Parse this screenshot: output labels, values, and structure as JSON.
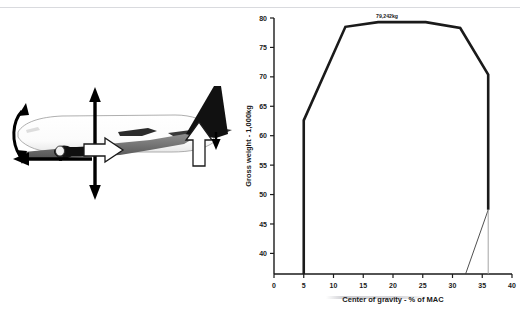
{
  "figure": {
    "name": "cg-envelope-figure",
    "panels": [
      "aircraft-force-diagram",
      "cg-envelope-chart"
    ]
  },
  "aircraft_diagram": {
    "name": "aircraft-side-view-force-diagram",
    "description": "Side view silhouette of a twin-engine jet airliner with force and moment arrows",
    "elements": [
      {
        "id": "fuselage",
        "label": "aircraft-fuselage"
      },
      {
        "id": "wing",
        "label": "aircraft-wing"
      },
      {
        "id": "vertical-stabilizer",
        "label": "aircraft-vertical-stabilizer"
      },
      {
        "id": "horizontal-stabilizer",
        "label": "aircraft-horizontal-stabilizer"
      },
      {
        "id": "engine",
        "label": "aircraft-engine-nacelle"
      },
      {
        "id": "lift-arrow",
        "label": "lift-arrow-up"
      },
      {
        "id": "weight-arrow",
        "label": "weight-arrow-down"
      },
      {
        "id": "thrust-arrow",
        "label": "thrust-arrow-right"
      },
      {
        "id": "drag-arrow",
        "label": "drag-arrow-left"
      },
      {
        "id": "pitch-arrow",
        "label": "pitch-moment-curved-arrow"
      },
      {
        "id": "tail-up-arrow",
        "label": "tail-load-arrow-up"
      },
      {
        "id": "tail-down-arrow",
        "label": "tail-load-arrow-down"
      }
    ]
  },
  "chart_data": {
    "type": "line",
    "title": "",
    "xlabel": "Center of gravity - % of MAC",
    "ylabel": "Gross weight - 1,000kg",
    "xlim": [
      0,
      40
    ],
    "ylim": [
      36.5,
      80
    ],
    "xticks": [
      0,
      5,
      10,
      15,
      20,
      25,
      30,
      35,
      40
    ],
    "xtick_labels": [
      "0",
      "5",
      "10",
      "15",
      "20",
      "25",
      "30",
      "35",
      "40"
    ],
    "yticks": [
      40,
      45,
      50,
      55,
      60,
      65,
      70,
      75,
      80
    ],
    "ytick_labels": [
      "40",
      "45",
      "50",
      "55",
      "60",
      "65",
      "70",
      "75",
      "80"
    ],
    "grid": false,
    "legend": null,
    "annotations": [
      {
        "text": "79,242kg",
        "x": 19.0,
        "y": 79.3,
        "name": "max-takeoff-weight-label"
      }
    ],
    "series": [
      {
        "name": "cg-envelope-boundary",
        "style": "solid-thick-black",
        "color": "#1a1a1a",
        "points": [
          [
            5.0,
            36.5
          ],
          [
            5.0,
            62.6
          ],
          [
            12.0,
            78.5
          ],
          [
            17.5,
            79.3
          ],
          [
            25.5,
            79.3
          ],
          [
            31.3,
            78.3
          ],
          [
            36.0,
            70.4
          ],
          [
            36.0,
            47.4
          ]
        ]
      },
      {
        "name": "aft-limit-taper-line",
        "style": "solid-thin-black",
        "color": "#3c3c3c",
        "points": [
          [
            36.0,
            47.4
          ],
          [
            32.2,
            36.5
          ]
        ]
      },
      {
        "name": "aft-reference-line",
        "style": "solid-thin-gray",
        "color": "#9a9a9a",
        "points": [
          [
            36.0,
            47.4
          ],
          [
            36.0,
            36.5
          ]
        ]
      }
    ]
  }
}
